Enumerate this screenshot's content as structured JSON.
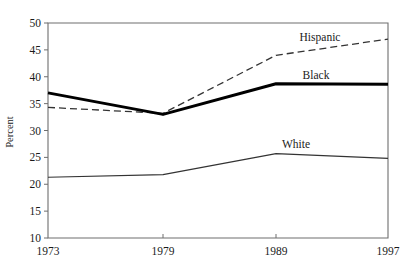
{
  "chart_data": {
    "type": "line",
    "title": "",
    "xlabel": "",
    "ylabel": "Percent",
    "categories": [
      "1973",
      "1979",
      "1989",
      "1997"
    ],
    "x": [
      1973,
      1979,
      1989,
      1997
    ],
    "ylim": [
      10,
      50
    ],
    "yticks": [
      10,
      15,
      20,
      25,
      30,
      35,
      40,
      45,
      50
    ],
    "ytick_labels": [
      "10",
      "15",
      "20",
      "25",
      "30",
      "35",
      "40",
      "45",
      "50"
    ],
    "xtick_labels": [
      "1973",
      "1979",
      "1989",
      "1997"
    ],
    "grid": false,
    "legend": "inline-labels",
    "series": [
      {
        "name": "Hispanic",
        "label": "Hispanic",
        "style": "dashed",
        "color": "#333333",
        "width": 1.3,
        "values": [
          34.3,
          33.2,
          44.0,
          47.0
        ]
      },
      {
        "name": "Black",
        "label": "Black",
        "style": "solid-thick",
        "color": "#000000",
        "width": 3.0,
        "values": [
          37.0,
          33.0,
          38.7,
          38.6
        ]
      },
      {
        "name": "White",
        "label": "White",
        "style": "solid-thin",
        "color": "#333333",
        "width": 1.1,
        "values": [
          21.3,
          21.8,
          25.7,
          24.8
        ]
      }
    ],
    "annotations": [
      {
        "text": "Hispanic",
        "x_px": 320,
        "y_px": 41
      },
      {
        "text": "Black",
        "x_px": 316,
        "y_px": 79
      },
      {
        "text": "White",
        "x_px": 296,
        "y_px": 148
      }
    ]
  },
  "axes": {
    "y_axis_title": "Percent"
  }
}
